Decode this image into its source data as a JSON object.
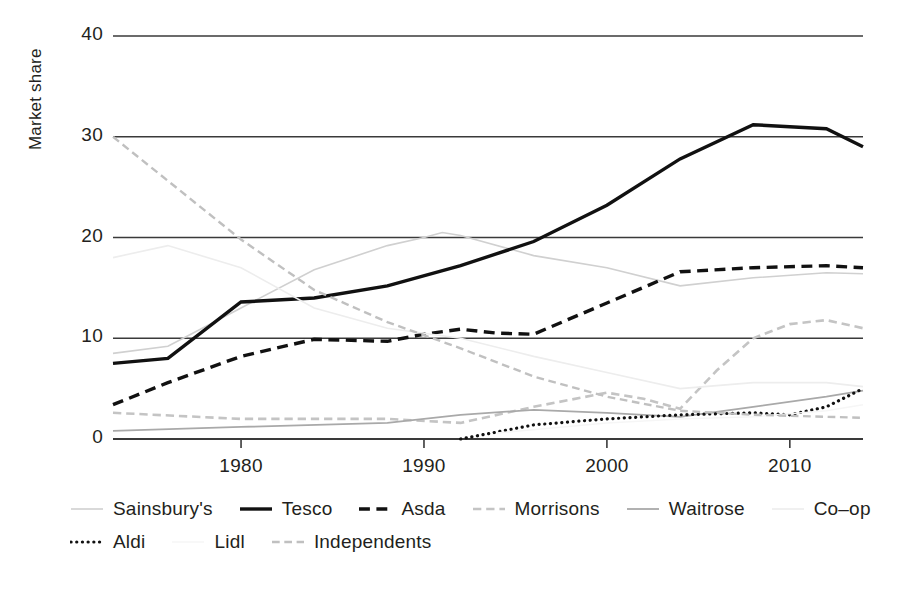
{
  "chart_data": {
    "type": "line",
    "title": "",
    "xlabel": "",
    "ylabel": "Market share",
    "xlim": [
      1973,
      2014
    ],
    "ylim": [
      0,
      40
    ],
    "yticks": [
      0,
      10,
      20,
      30,
      40
    ],
    "xticks": [
      1980,
      1990,
      2000,
      2010
    ],
    "grid": "horizontal",
    "legend_position": "below",
    "series": [
      {
        "name": "Sainsbury's",
        "style": "solid",
        "color": "#d0d0d0",
        "width": 1.6,
        "points": [
          [
            1973,
            8.5
          ],
          [
            1976,
            9.2
          ],
          [
            1980,
            13.0
          ],
          [
            1984,
            16.8
          ],
          [
            1988,
            19.2
          ],
          [
            1990,
            20.0
          ],
          [
            1991,
            20.5
          ],
          [
            1992,
            20.2
          ],
          [
            1996,
            18.2
          ],
          [
            2000,
            17.0
          ],
          [
            2004,
            15.2
          ],
          [
            2008,
            16.0
          ],
          [
            2012,
            16.5
          ],
          [
            2014,
            16.4
          ]
        ]
      },
      {
        "name": "Tesco",
        "style": "solid",
        "color": "#111111",
        "width": 3.4,
        "points": [
          [
            1973,
            7.5
          ],
          [
            1976,
            8.0
          ],
          [
            1980,
            13.6
          ],
          [
            1984,
            14.0
          ],
          [
            1988,
            15.2
          ],
          [
            1992,
            17.2
          ],
          [
            1996,
            19.6
          ],
          [
            2000,
            23.2
          ],
          [
            2004,
            27.8
          ],
          [
            2008,
            31.2
          ],
          [
            2012,
            30.8
          ],
          [
            2014,
            29.0
          ]
        ]
      },
      {
        "name": "Asda",
        "style": "dashed",
        "color": "#111111",
        "width": 3.4,
        "points": [
          [
            1973,
            3.4
          ],
          [
            1976,
            5.6
          ],
          [
            1980,
            8.2
          ],
          [
            1984,
            9.9
          ],
          [
            1988,
            9.7
          ],
          [
            1990,
            10.4
          ],
          [
            1992,
            10.9
          ],
          [
            1994,
            10.5
          ],
          [
            1996,
            10.4
          ],
          [
            2000,
            13.5
          ],
          [
            2004,
            16.6
          ],
          [
            2008,
            17.0
          ],
          [
            2012,
            17.2
          ],
          [
            2014,
            17.0
          ]
        ]
      },
      {
        "name": "Morrisons",
        "style": "dashed",
        "color": "#c4c4c4",
        "width": 2.6,
        "points": [
          [
            1973,
            2.6
          ],
          [
            1980,
            2.0
          ],
          [
            1988,
            2.0
          ],
          [
            1992,
            1.6
          ],
          [
            1996,
            3.2
          ],
          [
            2000,
            4.6
          ],
          [
            2002,
            4.0
          ],
          [
            2004,
            3.0
          ],
          [
            2006,
            6.8
          ],
          [
            2008,
            10.0
          ],
          [
            2010,
            11.4
          ],
          [
            2012,
            11.8
          ],
          [
            2014,
            11.0
          ]
        ]
      },
      {
        "name": "Waitrose",
        "style": "solid",
        "color": "#a9a9a9",
        "width": 1.8,
        "points": [
          [
            1973,
            0.8
          ],
          [
            1980,
            1.2
          ],
          [
            1988,
            1.6
          ],
          [
            1992,
            2.4
          ],
          [
            1996,
            2.9
          ],
          [
            2000,
            2.6
          ],
          [
            2004,
            2.2
          ],
          [
            2008,
            3.2
          ],
          [
            2012,
            4.2
          ],
          [
            2014,
            4.8
          ]
        ]
      },
      {
        "name": "Co-op",
        "style": "solid",
        "color": "#ededed",
        "width": 1.6,
        "points": [
          [
            1973,
            18.0
          ],
          [
            1976,
            19.2
          ],
          [
            1980,
            17.0
          ],
          [
            1984,
            13.0
          ],
          [
            1988,
            11.0
          ],
          [
            1992,
            10.0
          ],
          [
            1996,
            8.2
          ],
          [
            2000,
            6.6
          ],
          [
            2004,
            5.0
          ],
          [
            2008,
            5.6
          ],
          [
            2012,
            5.6
          ],
          [
            2014,
            5.2
          ]
        ]
      },
      {
        "name": "Aldi",
        "style": "dotted",
        "color": "#111111",
        "width": 3.2,
        "points": [
          [
            1992,
            0.0
          ],
          [
            1996,
            1.4
          ],
          [
            2000,
            2.0
          ],
          [
            2004,
            2.4
          ],
          [
            2008,
            2.6
          ],
          [
            2010,
            2.4
          ],
          [
            2012,
            3.2
          ],
          [
            2014,
            5.0
          ]
        ]
      },
      {
        "name": "Lidl",
        "style": "solid",
        "color": "#f6f6f6",
        "width": 1.5,
        "points": [
          [
            1994,
            0.6
          ],
          [
            2000,
            1.6
          ],
          [
            2004,
            2.0
          ],
          [
            2008,
            2.2
          ],
          [
            2012,
            2.8
          ],
          [
            2014,
            3.4
          ]
        ]
      },
      {
        "name": "Independents",
        "style": "dashed",
        "color": "#c0c0c0",
        "width": 2.4,
        "points": [
          [
            1973,
            30.0
          ],
          [
            1980,
            19.8
          ],
          [
            1984,
            14.8
          ],
          [
            1988,
            11.6
          ],
          [
            1992,
            9.0
          ],
          [
            1996,
            6.2
          ],
          [
            2000,
            4.2
          ],
          [
            2004,
            2.8
          ],
          [
            2008,
            2.4
          ],
          [
            2012,
            2.2
          ],
          [
            2014,
            2.1
          ]
        ]
      }
    ]
  },
  "axis": {
    "ylabel": "Market share",
    "yticks": [
      "0",
      "10",
      "20",
      "30",
      "40"
    ],
    "xticks": [
      "1980",
      "1990",
      "2000",
      "2010"
    ]
  },
  "legend": {
    "rows": [
      [
        "Sainsbury's",
        "Tesco",
        "Asda",
        "Morrisons",
        "Waitrose",
        "Co–op"
      ],
      [
        "Aldi",
        "Lidl",
        "Independents"
      ]
    ]
  }
}
